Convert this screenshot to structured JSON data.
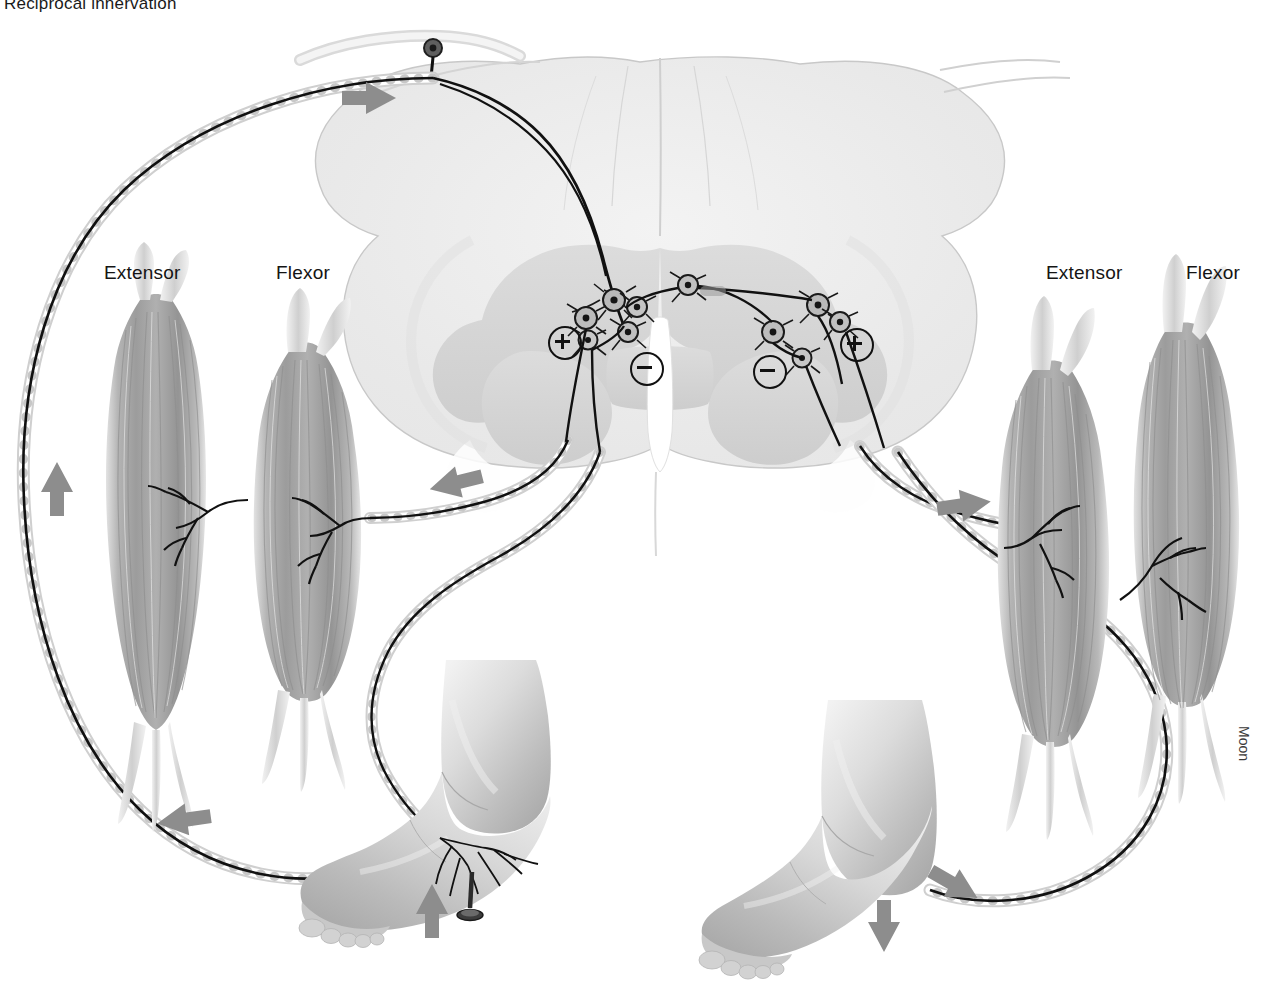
{
  "figure": {
    "title": "Reciprocal innervation",
    "signature": "Moon",
    "type": "anatomical-illustration"
  },
  "labels": {
    "left_extensor": "Extensor",
    "left_flexor": "Flexor",
    "right_extensor": "Extensor",
    "right_flexor": "Flexor"
  },
  "synapses": [
    {
      "name": "left-excitatory",
      "symbol": "+",
      "x": 548,
      "y": 326
    },
    {
      "name": "left-inhibitory",
      "symbol": "−",
      "x": 630,
      "y": 352
    },
    {
      "name": "right-inhibitory",
      "symbol": "−",
      "x": 753,
      "y": 355
    },
    {
      "name": "right-excitatory",
      "symbol": "+",
      "x": 840,
      "y": 328
    }
  ],
  "flow_arrows": [
    {
      "name": "afferent-ascending",
      "direction": "up",
      "x": 57,
      "y": 487
    },
    {
      "name": "afferent-to-cord",
      "direction": "right",
      "x": 370,
      "y": 98
    },
    {
      "name": "efferent-to-left-flexor",
      "direction": "left",
      "x": 455,
      "y": 483
    },
    {
      "name": "efferent-to-left-foot",
      "direction": "left",
      "x": 183,
      "y": 820
    },
    {
      "name": "efferent-to-right-extensor",
      "direction": "right",
      "x": 965,
      "y": 505
    },
    {
      "name": "efferent-to-right-foot",
      "direction": "right",
      "x": 955,
      "y": 885
    },
    {
      "name": "left-foot-flexion",
      "direction": "up",
      "x": 432,
      "y": 910
    },
    {
      "name": "right-foot-extension",
      "direction": "down",
      "x": 884,
      "y": 925
    }
  ],
  "structures": {
    "spinal_cord": "spinal-cord-cross-section",
    "dorsal_root_ganglion": "dorsal-root-ganglion",
    "left_foot": "left-foot-stimulated",
    "right_foot": "right-foot-extended",
    "noxious_stimulus": "tack-stimulus"
  },
  "colors": {
    "ink": "#111111",
    "arrow": "#8a8a8a",
    "cord_fill": "#ececec",
    "gray_matter": "#d8d8d8",
    "muscle_mid": "#a8a8a8",
    "muscle_light": "#d9d9d9",
    "skin_light": "#e6e6e6",
    "skin_mid": "#c2c2c2"
  }
}
